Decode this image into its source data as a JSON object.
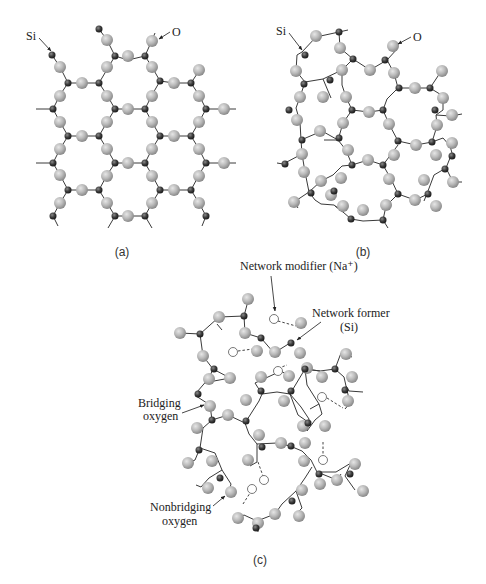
{
  "figure": {
    "panels": [
      {
        "id": "a",
        "caption": "(a)",
        "description": "Crystalline SiO2 — ordered hexagonal network",
        "labels": {
          "si": "Si",
          "o": "O"
        }
      },
      {
        "id": "b",
        "caption": "(b)",
        "description": "Amorphous (glassy) SiO2 — random network",
        "labels": {
          "si": "Si",
          "o": "O"
        }
      },
      {
        "id": "c",
        "caption": "(c)",
        "description": "Soda-silica glass with network modifiers",
        "labels": {
          "network_modifier": "Network modifier (Na⁺)",
          "network_former_line1": "Network former",
          "network_former_line2": "(Si)",
          "bridging_line1": "Bridging",
          "bridging_line2": "oxygen",
          "nonbridging_line1": "Nonbridging",
          "nonbridging_line2": "oxygen"
        }
      }
    ],
    "colors": {
      "silicon": "#3d3d3d",
      "oxygen": "#b8b8b8",
      "bond": "#3a3a3a",
      "sodium_outline": "#555555",
      "background": "#ffffff"
    },
    "legend": {
      "silicon_atom": "small dark sphere",
      "oxygen_atom": "large light gray sphere",
      "sodium_ion": "small open circle",
      "ionic_bond": "dashed line"
    }
  }
}
